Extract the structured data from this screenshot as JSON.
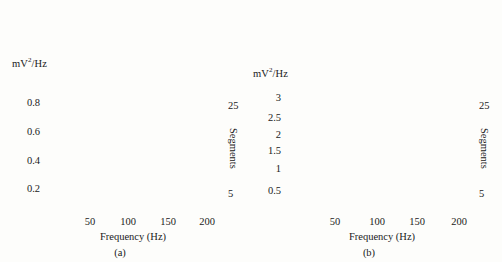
{
  "figure": {
    "background": "#fdfdfb",
    "ink": "#1a1a1a",
    "trace_color": "#9a9a9a",
    "trace_color_dark": "#2b2b2b"
  },
  "panels": [
    {
      "tag": "(a)",
      "ylabel": "mV",
      "ylabel_sup": "2",
      "ylabel_rest": "/Hz",
      "xlabel": "Frequency (Hz)",
      "right_axis_label": "Segments",
      "yticks": [
        "0.2",
        "0.4",
        "0.6",
        "0.8"
      ],
      "xticks": [
        "50",
        "100",
        "150",
        "200"
      ],
      "segment_ticks": [
        "25",
        "5"
      ]
    },
    {
      "tag": "(b)",
      "ylabel": "mV",
      "ylabel_sup": "2",
      "ylabel_rest": "/Hz",
      "xlabel": "Frequency (Hz)",
      "right_axis_label": "Segments",
      "yticks": [
        "0.5",
        "1",
        "1.5",
        "2",
        "2.5",
        "3"
      ],
      "xticks": [
        "50",
        "100",
        "150",
        "200"
      ],
      "segment_ticks": [
        "25",
        "5"
      ]
    }
  ],
  "chart_data": [
    {
      "type": "line",
      "title": "",
      "panel": "(a)",
      "xlabel": "Frequency (Hz)",
      "ylabel": "mV2/Hz",
      "right_axis": "Segments",
      "xlim": [
        0,
        210
      ],
      "ylim": [
        0,
        1.05
      ],
      "xticks": [
        50,
        100,
        150,
        200
      ],
      "yticks": [
        0.2,
        0.4,
        0.6,
        0.8
      ],
      "segment_range": [
        1,
        30
      ],
      "segment_ticks": [
        5,
        25
      ],
      "grid": false,
      "legend": "none",
      "description": "Waterfall stack of 30 power spectral density traces, one per segment, offset vertically. Each trace has a single dominant low-frequency peak near 10-14 Hz then decays to a near-flat baseline beyond 50 Hz.",
      "series": [
        {
          "name": "segment 1",
          "offset": 0.0,
          "peak_freq": 11,
          "peak_height": 0.68,
          "baseline": 0.012
        },
        {
          "name": "segment 2",
          "offset": 0.018,
          "peak_freq": 11,
          "peak_height": 0.66,
          "baseline": 0.012
        },
        {
          "name": "segment 3",
          "offset": 0.036,
          "peak_freq": 11,
          "peak_height": 0.65,
          "baseline": 0.012
        },
        {
          "name": "segment 4",
          "offset": 0.054,
          "peak_freq": 11,
          "peak_height": 0.64,
          "baseline": 0.012
        },
        {
          "name": "segment 5",
          "offset": 0.072,
          "peak_freq": 11,
          "peak_height": 0.63,
          "baseline": 0.012
        },
        {
          "name": "segment 6",
          "offset": 0.09,
          "peak_freq": 11,
          "peak_height": 0.62,
          "baseline": 0.012
        },
        {
          "name": "segment 7",
          "offset": 0.108,
          "peak_freq": 11,
          "peak_height": 0.61,
          "baseline": 0.012
        },
        {
          "name": "segment 8",
          "offset": 0.126,
          "peak_freq": 11,
          "peak_height": 0.6,
          "baseline": 0.012
        },
        {
          "name": "segment 9",
          "offset": 0.144,
          "peak_freq": 11,
          "peak_height": 0.59,
          "baseline": 0.012
        },
        {
          "name": "segment 10",
          "offset": 0.162,
          "peak_freq": 11,
          "peak_height": 0.58,
          "baseline": 0.012
        },
        {
          "name": "segment 11",
          "offset": 0.18,
          "peak_freq": 11,
          "peak_height": 0.57,
          "baseline": 0.012
        },
        {
          "name": "segment 12",
          "offset": 0.198,
          "peak_freq": 11,
          "peak_height": 0.56,
          "baseline": 0.012
        },
        {
          "name": "segment 13",
          "offset": 0.216,
          "peak_freq": 11,
          "peak_height": 0.55,
          "baseline": 0.012
        },
        {
          "name": "segment 14",
          "offset": 0.234,
          "peak_freq": 11,
          "peak_height": 0.54,
          "baseline": 0.012
        },
        {
          "name": "segment 15",
          "offset": 0.252,
          "peak_freq": 11,
          "peak_height": 0.53,
          "baseline": 0.012
        },
        {
          "name": "segment 16",
          "offset": 0.27,
          "peak_freq": 11,
          "peak_height": 0.52,
          "baseline": 0.012
        },
        {
          "name": "segment 17",
          "offset": 0.288,
          "peak_freq": 11,
          "peak_height": 0.51,
          "baseline": 0.012
        },
        {
          "name": "segment 18",
          "offset": 0.306,
          "peak_freq": 11,
          "peak_height": 0.5,
          "baseline": 0.012
        },
        {
          "name": "segment 19",
          "offset": 0.324,
          "peak_freq": 11,
          "peak_height": 0.49,
          "baseline": 0.012
        },
        {
          "name": "segment 20",
          "offset": 0.342,
          "peak_freq": 11,
          "peak_height": 0.48,
          "baseline": 0.012
        },
        {
          "name": "segment 21",
          "offset": 0.36,
          "peak_freq": 11,
          "peak_height": 0.47,
          "baseline": 0.012
        },
        {
          "name": "segment 22",
          "offset": 0.378,
          "peak_freq": 11,
          "peak_height": 0.46,
          "baseline": 0.012
        },
        {
          "name": "segment 23",
          "offset": 0.396,
          "peak_freq": 11,
          "peak_height": 0.45,
          "baseline": 0.012
        },
        {
          "name": "segment 24",
          "offset": 0.414,
          "peak_freq": 11,
          "peak_height": 0.44,
          "baseline": 0.012
        },
        {
          "name": "segment 25",
          "offset": 0.432,
          "peak_freq": 11,
          "peak_height": 0.43,
          "baseline": 0.012
        },
        {
          "name": "segment 26",
          "offset": 0.45,
          "peak_freq": 11,
          "peak_height": 0.44,
          "baseline": 0.012
        },
        {
          "name": "segment 27",
          "offset": 0.468,
          "peak_freq": 11,
          "peak_height": 0.46,
          "baseline": 0.012
        },
        {
          "name": "segment 28",
          "offset": 0.486,
          "peak_freq": 11,
          "peak_height": 0.49,
          "baseline": 0.012
        },
        {
          "name": "segment 29",
          "offset": 0.504,
          "peak_freq": 11,
          "peak_height": 0.53,
          "baseline": 0.012
        },
        {
          "name": "segment 30",
          "offset": 0.522,
          "peak_freq": 11,
          "peak_height": 0.58,
          "baseline": 0.012
        }
      ]
    },
    {
      "type": "line",
      "title": "",
      "panel": "(b)",
      "xlabel": "Frequency (Hz)",
      "ylabel": "mV2/Hz",
      "right_axis": "Segments",
      "xlim": [
        0,
        210
      ],
      "ylim": [
        0,
        3.6
      ],
      "xticks": [
        50,
        100,
        150,
        200
      ],
      "yticks": [
        0.5,
        1,
        1.5,
        2,
        2.5,
        3
      ],
      "segment_range": [
        1,
        30
      ],
      "segment_ticks": [
        5,
        25
      ],
      "grid": false,
      "legend": "none",
      "description": "Waterfall stack of 30 power spectral density traces with larger vertical scale. Lower segments show a single sharp low-frequency peak near 10 Hz; upper segments develop a strong narrow spike near 8-12 Hz that runs off the top of the axes plus a broad secondary hump near 40-55 Hz.",
      "series": [
        {
          "name": "segment 1",
          "offset": 0.0,
          "peak_freq": 10,
          "peak_height": 1.85,
          "secondary_freq": 0,
          "secondary_height": 0.0,
          "baseline": 0.04
        },
        {
          "name": "segment 2",
          "offset": 0.06,
          "peak_freq": 10,
          "peak_height": 1.8,
          "secondary_freq": 0,
          "secondary_height": 0.0,
          "baseline": 0.04
        },
        {
          "name": "segment 3",
          "offset": 0.12,
          "peak_freq": 10,
          "peak_height": 1.75,
          "secondary_freq": 0,
          "secondary_height": 0.0,
          "baseline": 0.04
        },
        {
          "name": "segment 4",
          "offset": 0.18,
          "peak_freq": 10,
          "peak_height": 1.7,
          "secondary_freq": 0,
          "secondary_height": 0.0,
          "baseline": 0.05
        },
        {
          "name": "segment 5",
          "offset": 0.24,
          "peak_freq": 10,
          "peak_height": 1.65,
          "secondary_freq": 45,
          "secondary_height": 0.04,
          "baseline": 0.05
        },
        {
          "name": "segment 6",
          "offset": 0.3,
          "peak_freq": 10,
          "peak_height": 1.6,
          "secondary_freq": 45,
          "secondary_height": 0.06,
          "baseline": 0.05
        },
        {
          "name": "segment 7",
          "offset": 0.36,
          "peak_freq": 10,
          "peak_height": 1.58,
          "secondary_freq": 45,
          "secondary_height": 0.08,
          "baseline": 0.06
        },
        {
          "name": "segment 8",
          "offset": 0.42,
          "peak_freq": 10,
          "peak_height": 1.56,
          "secondary_freq": 45,
          "secondary_height": 0.1,
          "baseline": 0.06
        },
        {
          "name": "segment 9",
          "offset": 0.48,
          "peak_freq": 10,
          "peak_height": 1.54,
          "secondary_freq": 45,
          "secondary_height": 0.12,
          "baseline": 0.06
        },
        {
          "name": "segment 10",
          "offset": 0.54,
          "peak_freq": 10,
          "peak_height": 1.52,
          "secondary_freq": 45,
          "secondary_height": 0.14,
          "baseline": 0.07
        },
        {
          "name": "segment 11",
          "offset": 0.6,
          "peak_freq": 10,
          "peak_height": 1.5,
          "secondary_freq": 45,
          "secondary_height": 0.17,
          "baseline": 0.07
        },
        {
          "name": "segment 12",
          "offset": 0.66,
          "peak_freq": 10,
          "peak_height": 1.5,
          "secondary_freq": 45,
          "secondary_height": 0.2,
          "baseline": 0.07
        },
        {
          "name": "segment 13",
          "offset": 0.72,
          "peak_freq": 10,
          "peak_height": 1.52,
          "secondary_freq": 45,
          "secondary_height": 0.24,
          "baseline": 0.08
        },
        {
          "name": "segment 14",
          "offset": 0.78,
          "peak_freq": 10,
          "peak_height": 1.55,
          "secondary_freq": 45,
          "secondary_height": 0.28,
          "baseline": 0.08
        },
        {
          "name": "segment 15",
          "offset": 0.84,
          "peak_freq": 10,
          "peak_height": 1.6,
          "secondary_freq": 45,
          "secondary_height": 0.33,
          "baseline": 0.08
        },
        {
          "name": "segment 16",
          "offset": 0.9,
          "peak_freq": 10,
          "peak_height": 1.66,
          "secondary_freq": 45,
          "secondary_height": 0.38,
          "baseline": 0.09
        },
        {
          "name": "segment 17",
          "offset": 0.96,
          "peak_freq": 10,
          "peak_height": 1.74,
          "secondary_freq": 45,
          "secondary_height": 0.44,
          "baseline": 0.09
        },
        {
          "name": "segment 18",
          "offset": 1.02,
          "peak_freq": 10,
          "peak_height": 1.84,
          "secondary_freq": 45,
          "secondary_height": 0.5,
          "baseline": 0.09
        },
        {
          "name": "segment 19",
          "offset": 1.08,
          "peak_freq": 10,
          "peak_height": 1.96,
          "secondary_freq": 45,
          "secondary_height": 0.56,
          "baseline": 0.1
        },
        {
          "name": "segment 20",
          "offset": 1.14,
          "peak_freq": 10,
          "peak_height": 2.1,
          "secondary_freq": 45,
          "secondary_height": 0.62,
          "baseline": 0.1
        },
        {
          "name": "segment 21",
          "offset": 1.2,
          "peak_freq": 10,
          "peak_height": 2.28,
          "secondary_freq": 45,
          "secondary_height": 0.66,
          "baseline": 0.1
        },
        {
          "name": "segment 22",
          "offset": 1.26,
          "peak_freq": 10,
          "peak_height": 2.5,
          "secondary_freq": 45,
          "secondary_height": 0.7,
          "baseline": 0.1
        },
        {
          "name": "segment 23",
          "offset": 1.32,
          "peak_freq": 10,
          "peak_height": 2.78,
          "secondary_freq": 45,
          "secondary_height": 0.72,
          "baseline": 0.1
        },
        {
          "name": "segment 24",
          "offset": 1.38,
          "peak_freq": 10,
          "peak_height": 3.1,
          "secondary_freq": 45,
          "secondary_height": 0.7,
          "baseline": 0.1
        },
        {
          "name": "segment 25",
          "offset": 1.44,
          "peak_freq": 10,
          "peak_height": 3.5,
          "secondary_freq": 45,
          "secondary_height": 0.66,
          "baseline": 0.1
        },
        {
          "name": "segment 26",
          "offset": 1.5,
          "peak_freq": 9,
          "peak_height": 4.0,
          "secondary_freq": 45,
          "secondary_height": 0.58,
          "baseline": 0.1
        },
        {
          "name": "segment 27",
          "offset": 1.56,
          "peak_freq": 9,
          "peak_height": 4.6,
          "secondary_freq": 45,
          "secondary_height": 0.48,
          "baseline": 0.1
        },
        {
          "name": "segment 28",
          "offset": 1.62,
          "peak_freq": 9,
          "peak_height": 5.3,
          "secondary_freq": 45,
          "secondary_height": 0.36,
          "baseline": 0.1
        },
        {
          "name": "segment 29",
          "offset": 1.68,
          "peak_freq": 8,
          "peak_height": 6.1,
          "secondary_freq": 45,
          "secondary_height": 0.24,
          "baseline": 0.1
        },
        {
          "name": "segment 30",
          "offset": 1.74,
          "peak_freq": 8,
          "peak_height": 7.0,
          "secondary_freq": 45,
          "secondary_height": 0.14,
          "baseline": 0.1
        }
      ]
    }
  ]
}
